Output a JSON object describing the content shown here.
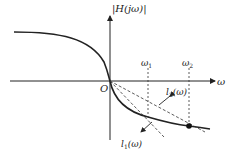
{
  "diagram": {
    "y_axis_label": "|H(jω)|",
    "x_axis_label": "ω",
    "origin_label": "O",
    "omega1_label": "ω",
    "omega1_sub": "1",
    "omega2_label": "ω",
    "omega2_sub": "2",
    "l1_label": "l",
    "l1_sub": "1",
    "l1_arg": "(ω)",
    "l2_label": "l",
    "l2_sub": "2",
    "l2_arg": "(ω)"
  }
}
